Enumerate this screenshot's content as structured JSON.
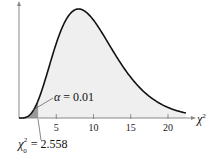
{
  "chart_data": {
    "type": "area",
    "title": "",
    "distribution": "chi-square",
    "degrees_of_freedom": 10,
    "xlabel": "χ²",
    "ylabel": "",
    "xlim": [
      0,
      23
    ],
    "x_ticks": [
      5,
      10,
      15,
      20
    ],
    "x_tick_labels": [
      "5",
      "10",
      "15",
      "20"
    ],
    "grid": false,
    "shaded_region": {
      "from": 0,
      "to": 2.558,
      "area": 0.01,
      "color": "#9a9a9a"
    },
    "body_fill_color": "#efefef",
    "curve_color": "#111111",
    "annotations": [
      {
        "text": "α = 0.01",
        "points_to": "left tail shaded area"
      },
      {
        "text": "χ²₀ = 2.558",
        "points_to": "critical value on x-axis"
      }
    ]
  },
  "labels": {
    "alpha_symbol": "α",
    "alpha_text": "= 0.01",
    "critical_symbol": "χ",
    "critical_sup": "2",
    "critical_sub": "0",
    "critical_value": "= 2.558",
    "x_axis_symbol": "χ",
    "x_axis_sup": "2",
    "ticks": [
      "5",
      "10",
      "15",
      "20"
    ]
  }
}
